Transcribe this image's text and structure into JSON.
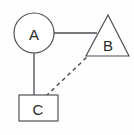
{
  "diagram": {
    "type": "node-link-diagram",
    "canvas": {
      "width": 134,
      "height": 135,
      "background": "#fefefe"
    },
    "stroke_color": "#4a4a52",
    "label_color": "#2b2b2b",
    "nodes": [
      {
        "id": "A",
        "label": "A",
        "shape": "circle",
        "cx": 34,
        "cy": 33,
        "r": 20
      },
      {
        "id": "B",
        "label": "B",
        "shape": "triangle",
        "apex_x": 108,
        "apex_y": 15,
        "base_left_x": 86,
        "base_right_x": 129,
        "base_y": 56,
        "label_x": 108,
        "label_y": 44
      },
      {
        "id": "C",
        "label": "C",
        "shape": "rectangle",
        "x": 19,
        "y": 95,
        "width": 39,
        "height": 26,
        "label_x": 38,
        "label_y": 108
      }
    ],
    "edges": [
      {
        "id": "A-B",
        "from": "A",
        "to": "B",
        "style": "solid",
        "x1": 54,
        "y1": 33,
        "x2": 97,
        "y2": 33
      },
      {
        "id": "A-C",
        "from": "A",
        "to": "C",
        "style": "solid",
        "x1": 34,
        "y1": 53,
        "x2": 34,
        "y2": 95
      },
      {
        "id": "C-B",
        "from": "C",
        "to": "B",
        "style": "dashed",
        "x1": 46,
        "y1": 96,
        "x2": 87,
        "y2": 57
      }
    ]
  }
}
